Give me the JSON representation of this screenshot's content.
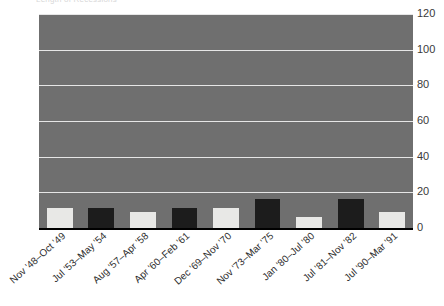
{
  "title_fragment": "Length of Recessions",
  "chart_data": {
    "type": "bar",
    "title": "Length of Recessions",
    "xlabel": "",
    "ylabel": "",
    "ylim": [
      0,
      120
    ],
    "yticks": [
      0,
      20,
      40,
      60,
      80,
      100,
      120
    ],
    "grid": true,
    "legend": "none",
    "plot_background": "#6f6f6f",
    "gridline_color": "#e6e6e6",
    "bar_colors": [
      "#e8e8e6",
      "#1c1c1c"
    ],
    "categories": [
      "Nov '48–Oct '49",
      "Jul '53–May '54",
      "Aug '57–Apr '58",
      "Apr '60–Feb '61",
      "Dec '69–Nov '70",
      "Nov '73–Mar '75",
      "Jan '80–Jul '80",
      "Jul '81–Nov '82",
      "Jul '90–Mar '91"
    ],
    "values": [
      11,
      11,
      9,
      11,
      11,
      16,
      6,
      16,
      9
    ]
  }
}
